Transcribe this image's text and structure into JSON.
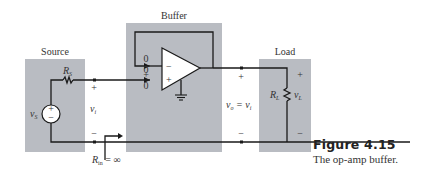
{
  "figure": {
    "number": "Figure 4.15",
    "caption": "The op-amp buffer."
  },
  "blocks": {
    "source": {
      "title": "Source",
      "resistor": "R",
      "resistor_sub": "S",
      "voltage": "v",
      "voltage_sub": "S",
      "plus": "+",
      "minus": "−"
    },
    "buffer": {
      "title": "Buffer",
      "inv_current": "0",
      "diff_top": "0",
      "diff_bottom": "0",
      "noninv_current": "0",
      "inv_sign": "−",
      "noninv_sign": "+",
      "diff_minus": "−",
      "diff_plus": "+"
    },
    "load": {
      "title": "Load",
      "resistor": "R",
      "resistor_sub": "L",
      "voltage": "v",
      "voltage_sub": "L",
      "plus": "+",
      "minus": "−"
    }
  },
  "labels": {
    "input_voltage": "v",
    "input_voltage_sub": "i",
    "input_plus": "+",
    "input_minus": "−",
    "output_expr_v": "v",
    "output_expr_o": "o",
    "output_expr_eq": " = v",
    "output_expr_i": "i",
    "output_plus": "+",
    "output_minus": "−",
    "rin_R": "R",
    "rin_sub": "in",
    "rin_eq": " = ∞"
  },
  "colors": {
    "block_fill": "#b9bcc2",
    "wire": "#1a1a1a",
    "text": "#333333"
  }
}
